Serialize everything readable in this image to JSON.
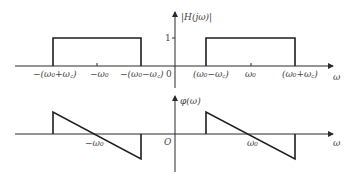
{
  "figure": {
    "magnitude_plot": {
      "y_label": "|H(jω)|",
      "x_label": "ω",
      "origin_label": "0",
      "level_label": "1",
      "ticks": [
        {
          "label": "−(ω₀+ω꜀)"
        },
        {
          "label": "−ω₀"
        },
        {
          "label": "−(ω₀−ω꜀)"
        },
        {
          "label": "(ω₀−ω꜀)"
        },
        {
          "label": "ω₀"
        },
        {
          "label": "(ω₀+ω꜀)"
        }
      ]
    },
    "phase_plot": {
      "y_label": "φ(ω)",
      "x_label": "ω",
      "origin_label": "O",
      "ticks": [
        {
          "label": "−ω₀"
        },
        {
          "label": "ω₀"
        }
      ]
    },
    "colors": {
      "line": "#1e1e1e",
      "text": "#444444",
      "background": "#ffffff"
    }
  }
}
